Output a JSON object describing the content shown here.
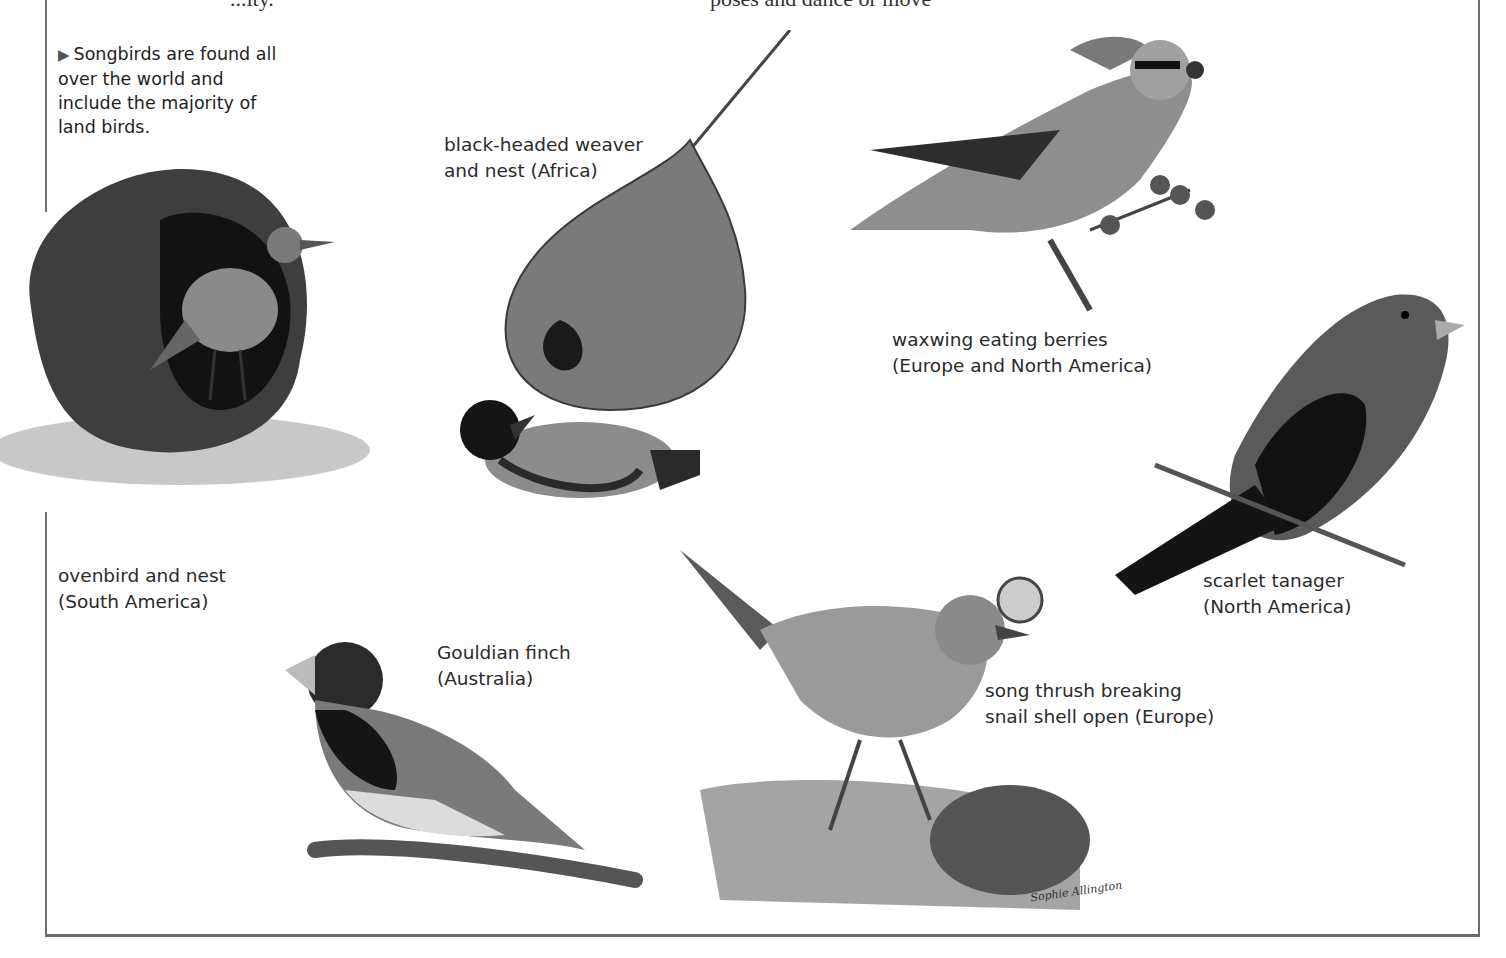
{
  "page": {
    "top_cut_text_left": "...ity.",
    "top_cut_text_right": "poses and dance or move"
  },
  "intro": {
    "bullet": "▶",
    "text": "Songbirds are found all over the world and include the majority of land birds."
  },
  "captions": {
    "weaver": {
      "line1": "black-headed weaver",
      "line2": "and nest (Africa)"
    },
    "waxwing": {
      "line1": "waxwing eating berries",
      "line2": "(Europe and North America)"
    },
    "ovenbird": {
      "line1": "ovenbird and nest",
      "line2": "(South America)"
    },
    "tanager": {
      "line1": "scarlet tanager",
      "line2": "(North America)"
    },
    "gouldian": {
      "line1": "Gouldian finch",
      "line2": "(Australia)"
    },
    "thrush": {
      "line1": "song thrush breaking",
      "line2": "snail shell open (Europe)"
    }
  },
  "illustrations": [
    {
      "id": "ovenbird",
      "label": "ovenbird illustration"
    },
    {
      "id": "weaver",
      "label": "black-headed weaver illustration"
    },
    {
      "id": "waxwing",
      "label": "waxwing illustration"
    },
    {
      "id": "tanager",
      "label": "scarlet tanager illustration"
    },
    {
      "id": "gouldian",
      "label": "Gouldian finch illustration"
    },
    {
      "id": "thrush",
      "label": "song thrush illustration"
    }
  ],
  "signature": "Sophie Allington",
  "colors": {
    "frame": "#6b6b6b",
    "text": "#2a2a2a",
    "background": "#ffffff"
  }
}
